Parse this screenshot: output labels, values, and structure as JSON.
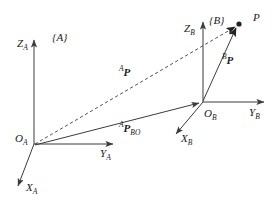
{
  "figure": {
    "type": "coordinate-frame-diagram",
    "background_color": "#ffffff",
    "line_color": "#3b3b3b",
    "text_color": "#1a1a1a"
  },
  "frames": {
    "A": {
      "label": "{A}",
      "origin_label": "O",
      "origin_sub": "A",
      "axes": {
        "z": {
          "name": "Z",
          "sub": "A"
        },
        "y": {
          "name": "Y",
          "sub": "A"
        },
        "x": {
          "name": "X",
          "sub": "A"
        }
      }
    },
    "B": {
      "label": "{B}",
      "origin_label": "O",
      "origin_sub": "B",
      "axes": {
        "z": {
          "name": "Z",
          "sub": "B"
        },
        "y": {
          "name": "Y",
          "sub": "B"
        },
        "x": {
          "name": "X",
          "sub": "B"
        }
      }
    }
  },
  "point": {
    "label": "P"
  },
  "vectors": {
    "a_p": {
      "pre": "A",
      "name": "P",
      "sub": "",
      "style": "dashed",
      "description": "position of P in frame A"
    },
    "b_p": {
      "pre": "B",
      "name": "P",
      "sub": "",
      "style": "solid",
      "description": "position of P in frame B"
    },
    "a_p_bo": {
      "pre": "A",
      "name": "P",
      "sub": "BO",
      "style": "solid",
      "description": "origin of frame B expressed in frame A"
    }
  }
}
